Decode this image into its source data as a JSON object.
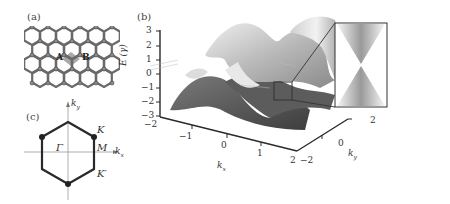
{
  "figure": {
    "panels": {
      "a": {
        "label": "(a)",
        "description": "Graphene honeycomb lattice with shaded unit cell",
        "site_labels": [
          "A",
          "B"
        ]
      },
      "b": {
        "label": "(b)",
        "description": "3D band structure E(k) of graphene with zoomed Dirac cone inset",
        "z_axis_label": "E (γ)",
        "z_ticks": [
          "3",
          "2",
          "1",
          "0",
          "−1",
          "−2",
          "−3"
        ],
        "x_axis_label": "k",
        "x_axis_sub": "x",
        "x_ticks": [
          "−2",
          "−1",
          "0",
          "1",
          "2"
        ],
        "y_axis_label": "k",
        "y_axis_sub": "y",
        "y_ticks": [
          "−2",
          "0",
          "2"
        ]
      },
      "c": {
        "label": "(c)",
        "description": "First Brillouin zone of graphene",
        "axis_ky": "k",
        "axis_ky_sub": "y",
        "axis_kx": "k",
        "axis_kx_sub": "x",
        "gamma": "Γ",
        "M": "M",
        "K": "K",
        "K_prime": "K′"
      }
    }
  },
  "colors": {
    "line": "#2a2a2a",
    "surface_dark": "#5a5a5a",
    "surface_mid": "#8c8c8c",
    "surface_light": "#d6d6d6",
    "atom": "#8a8a8a",
    "cell": "#9a9a9a"
  }
}
